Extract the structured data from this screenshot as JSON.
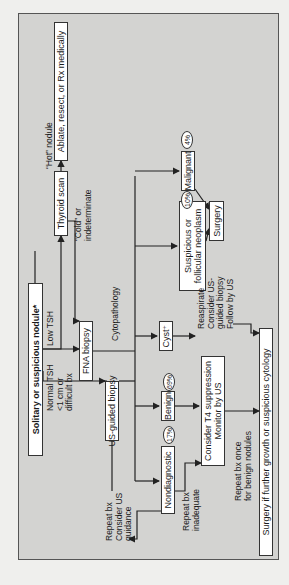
{
  "diagram": {
    "type": "flowchart",
    "orientation": "rotated-90-ccw",
    "nodes": {
      "start": "Solitary or suspicious nodule*",
      "thyroid_scan": "Thyroid scan",
      "ablate": "Ablate, resect, or Rx medically",
      "fna": "FNA biopsy",
      "us_biopsy": "US-guided biopsy",
      "malignant": "Malignant",
      "suspicious": "Suspicious or follicular neoplasm",
      "surgery": "Surgery",
      "cyst": "Cyst⁺",
      "benign": "Benign",
      "t4": "Consider T4 suppression Monitor by US",
      "nondiagnostic": "Nondiagnostic",
      "surgery_if": "Surgery if further growth or suspicious cytology"
    },
    "labels": {
      "low_tsh": "Low TSH",
      "normal_tsh": "Normal TSH\n<1 cm or\ndifficult bx",
      "hot": "“Hot” nodule",
      "cold": "“Cold” or\nindeterminate",
      "cytopathology": "Cytopathology",
      "repeat_us": "Repeat bx\nConsider US\nguidance",
      "reaspirate": "Reaspirate\nConsider US-\nguided biopsy\nFollow by US",
      "repeat_inadequate": "Repeat bx\ninadequate",
      "repeat_once": "Repeat bx once\nfor benign nodules"
    },
    "percentages": {
      "malignant": "4%",
      "suspicious": "10%",
      "benign": "69%",
      "nondiagnostic": "17%"
    },
    "colors": {
      "background": "#d3d3d1",
      "box": "#ffffff",
      "line": "#222222"
    }
  }
}
